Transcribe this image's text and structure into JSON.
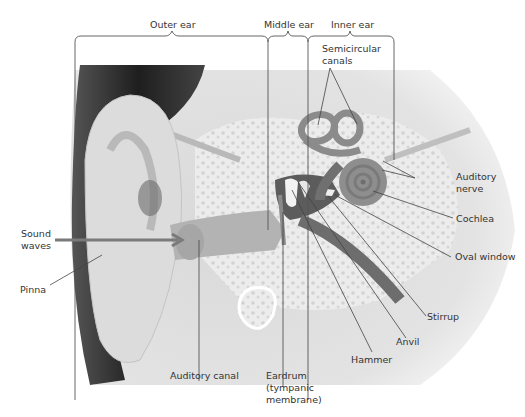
{
  "diagram": {
    "sections": [
      {
        "label": "Outer ear"
      },
      {
        "label": "Middle ear"
      },
      {
        "label": "Inner ear"
      }
    ],
    "labels": {
      "semicircular_canals_1": "Semicircular",
      "semicircular_canals_2": "canals",
      "auditory_nerve_1": "Auditory",
      "auditory_nerve_2": "nerve",
      "cochlea": "Cochlea",
      "oval_window": "Oval window",
      "stirrup": "Stirrup",
      "anvil": "Anvil",
      "hammer": "Hammer",
      "eardrum_1": "Eardrum",
      "eardrum_2": "(tympanic",
      "eardrum_3": "membrane)",
      "auditory_canal": "Auditory canal",
      "sound_waves_1": "Sound",
      "sound_waves_2": "waves",
      "pinna": "Pinna"
    },
    "colors": {
      "label_text": "#333333",
      "leader_line": "#444444",
      "bone": "#e6e6e6",
      "tissue": "#9a9a9a",
      "dark_tissue": "#5a5a5a",
      "hair": "#2a2a2a",
      "skin": "#cfcfcf"
    }
  }
}
